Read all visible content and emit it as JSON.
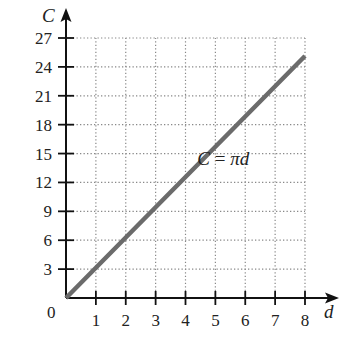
{
  "chart_data": {
    "type": "line",
    "title": "",
    "xlabel": "d",
    "ylabel": "C",
    "xlim": [
      0,
      8
    ],
    "ylim": [
      0,
      27
    ],
    "x_ticks": [
      1,
      2,
      3,
      4,
      5,
      6,
      7,
      8
    ],
    "y_ticks": [
      3,
      6,
      9,
      12,
      15,
      18,
      21,
      24,
      27
    ],
    "origin_label": "0",
    "grid": true,
    "grid_style": "dotted",
    "series": [
      {
        "name": "C = πd",
        "x": [
          0,
          1,
          2,
          3,
          4,
          5,
          6,
          7,
          8
        ],
        "values": [
          0,
          3.14,
          6.28,
          9.42,
          12.57,
          15.71,
          18.85,
          21.99,
          25.13
        ],
        "color": "#6b6b6b"
      }
    ],
    "annotations": [
      {
        "text": "C = πd",
        "x": 5.4,
        "y": 15.3
      }
    ],
    "legend": "none"
  },
  "colors": {
    "axis": "#111111",
    "grid": "#888888",
    "line": "#6b6b6b",
    "text": "#222222"
  }
}
